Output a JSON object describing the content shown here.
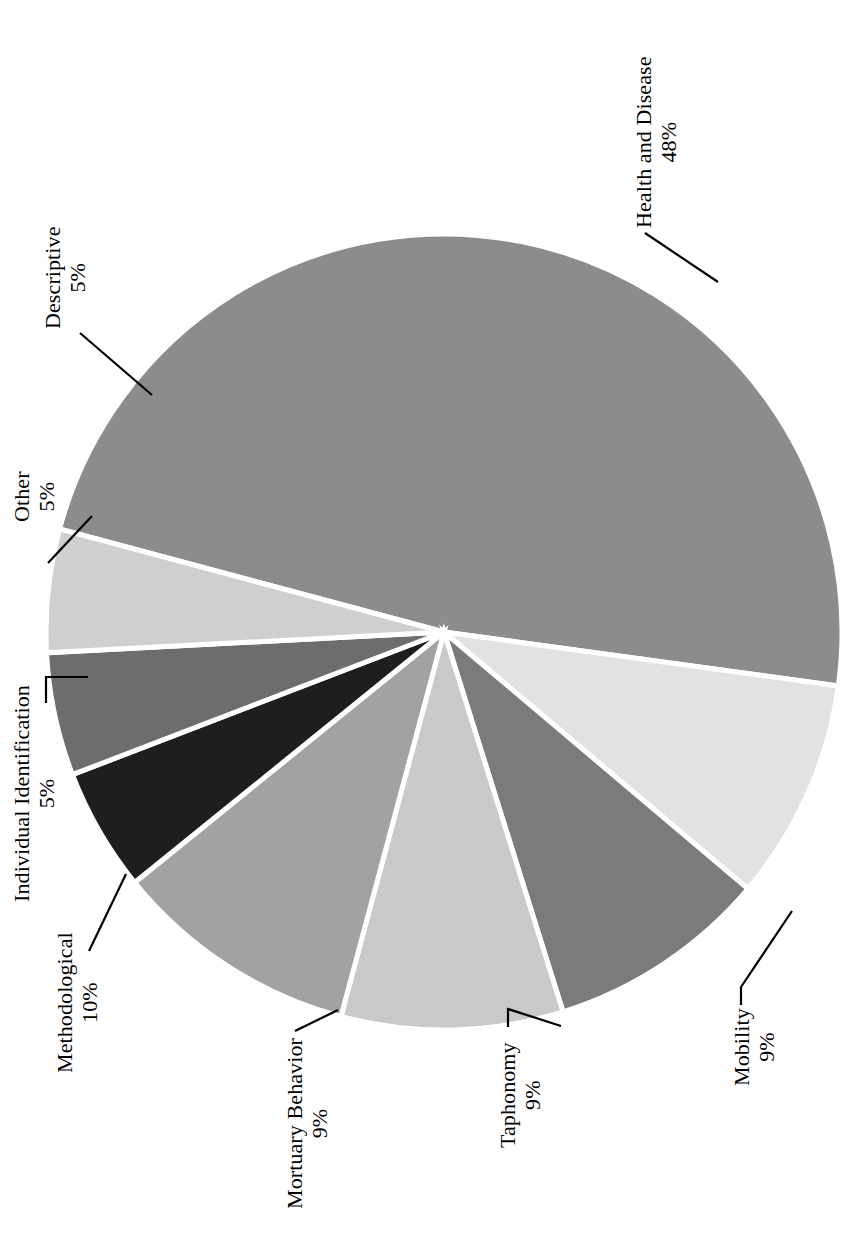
{
  "figure": {
    "width": 867,
    "height": 1235,
    "background": "#ffffff",
    "rotation_note": "whole chart rotated 90 degrees; labels read bottom-to-top"
  },
  "chart_data": {
    "type": "pie",
    "title": "",
    "subtitle": "",
    "xlabel": "",
    "ylabel": "",
    "legend_position": "none",
    "grid": false,
    "label_format": "category + percent",
    "total_percent": 100,
    "categories": [
      "Health and Disease",
      "Mobility",
      "Taphonomy",
      "Mortuary Behavior",
      "Methodological",
      "Individual Identification",
      "Other",
      "Descriptive"
    ],
    "values": [
      48,
      9,
      9,
      9,
      10,
      5,
      5,
      5
    ],
    "colors": [
      "#8c8c8c",
      "#e2e2e2",
      "#7b7b7b",
      "#c9c9c9",
      "#a2a2a2",
      "#1e1e1e",
      "#6d6d6d",
      "#cfcfcf"
    ],
    "slices": [
      {
        "label": "Health and Disease",
        "percent_text": "48%",
        "value": 48,
        "color": "#8c8c8c",
        "start_angle": 0,
        "end_angle": 172.8
      },
      {
        "label": "Mobility",
        "percent_text": "9%",
        "value": 9,
        "color": "#e2e2e2",
        "start_angle": 172.8,
        "end_angle": 205.2
      },
      {
        "label": "Taphonomy",
        "percent_text": "9%",
        "value": 9,
        "color": "#7b7b7b",
        "start_angle": 205.2,
        "end_angle": 237.6
      },
      {
        "label": "Mortuary Behavior",
        "percent_text": "9%",
        "value": 9,
        "color": "#c9c9c9",
        "start_angle": 237.6,
        "end_angle": 270.0
      },
      {
        "label": "Methodological",
        "percent_text": "10%",
        "value": 10,
        "color": "#a2a2a2",
        "start_angle": 270.0,
        "end_angle": 306.0
      },
      {
        "label": "Individual Identification",
        "percent_text": "5%",
        "value": 5,
        "color": "#1e1e1e",
        "start_angle": 306.0,
        "end_angle": 324.0
      },
      {
        "label": "Other",
        "percent_text": "5%",
        "value": 5,
        "color": "#6d6d6d",
        "start_angle": 324.0,
        "end_angle": 342.0
      },
      {
        "label": "Descriptive",
        "percent_text": "5%",
        "value": 5,
        "color": "#cfcfcf",
        "start_angle": 342.0,
        "end_angle": 360.0
      }
    ]
  },
  "labels": {
    "health": {
      "category": "Health and Disease",
      "percent": "48%"
    },
    "mobility": {
      "category": "Mobility",
      "percent": "9%"
    },
    "taphonomy": {
      "category": "Taphonomy",
      "percent": "9%"
    },
    "mortuary": {
      "category": "Mortuary Behavior",
      "percent": "9%"
    },
    "methodological": {
      "category": "Methodological",
      "percent": "10%"
    },
    "individual": {
      "category": "Individual Identification",
      "percent": "5%"
    },
    "other": {
      "category": "Other",
      "percent": "5%"
    },
    "descriptive": {
      "category": "Descriptive",
      "percent": "5%"
    }
  }
}
